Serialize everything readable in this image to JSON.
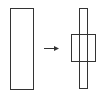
{
  "diagram": {
    "stroke_color": "#333333",
    "background": "#ffffff",
    "before": {
      "shape": "tall-rectangle",
      "x": 10,
      "y": 8,
      "w": 23,
      "h": 81
    },
    "arrow": {
      "x1": 44,
      "y1": 48,
      "x2": 59,
      "y2": 48
    },
    "after": {
      "bar": {
        "shape": "thin-rectangle",
        "x": 79,
        "y": 8,
        "w": 8,
        "h": 80
      },
      "box": {
        "shape": "square",
        "x": 71,
        "y": 34,
        "w": 24,
        "h": 27
      }
    }
  }
}
